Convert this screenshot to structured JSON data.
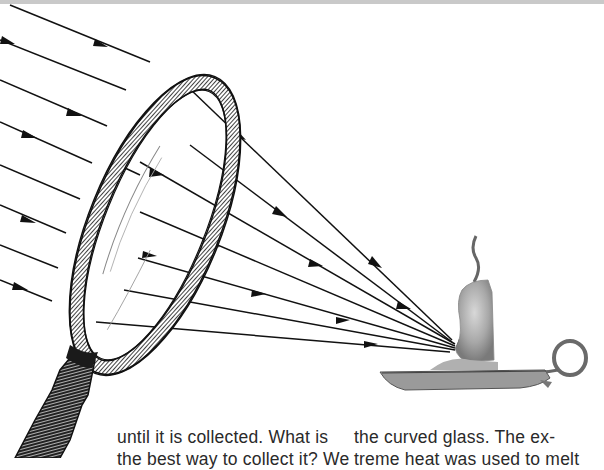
{
  "page": {
    "figure": {
      "subject": "magnifying glass focusing sunlight onto a candle",
      "elements": [
        "light-rays",
        "magnifying-glass",
        "candle",
        "candle-holder"
      ],
      "ray_color": "#111111",
      "lens_rim_color": "#1a1a1a",
      "candle_color": "#9a9a9a"
    },
    "text": {
      "left_column": [
        "until it is collected. What is",
        "the best way to collect it? We"
      ],
      "right_column": [
        "the curved glass. The ex-",
        "treme heat was used to melt"
      ]
    },
    "colors": {
      "background": "#ffffff",
      "top_band": "#c9c9c9",
      "text": "#2a2a2a"
    }
  }
}
